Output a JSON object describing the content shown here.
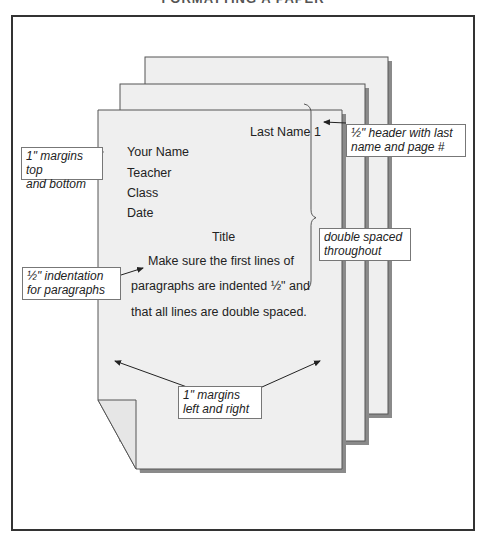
{
  "title": "FORMATTING A PAPER",
  "page": {
    "header": "Last Name 1",
    "heading_lines": [
      "Your Name",
      "Teacher",
      "Class",
      "Date"
    ],
    "title": "Title",
    "body_lines": [
      "Make sure the first lines of",
      "paragraphs are indented ½\" and",
      "that all lines are double spaced."
    ]
  },
  "callouts": {
    "margins_top_bottom": [
      "1\" margins top",
      "and bottom"
    ],
    "header": [
      "½\" header with last",
      "name and page #"
    ],
    "double_spaced": [
      "double spaced",
      "throughout"
    ],
    "indentation": [
      "½\" indentation",
      "for paragraphs"
    ],
    "margins_left_right": [
      "1\" margins",
      "left and right"
    ]
  },
  "colors": {
    "page_fill": "#efefef",
    "page_border": "#555555",
    "shadow": "#8a8a8a",
    "frame_border": "#333333"
  }
}
